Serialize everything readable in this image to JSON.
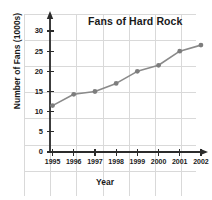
{
  "chart_data": {
    "type": "line",
    "title": "Fans of Hard Rock",
    "xlabel": "Year",
    "ylabel": "Number of Fans (1000s)",
    "categories": [
      "1995",
      "1996",
      "1997",
      "1998",
      "1999",
      "2000",
      "2001",
      "2002"
    ],
    "values": [
      11.5,
      14.3,
      15.0,
      17.0,
      20.0,
      21.5,
      25.0,
      26.5
    ],
    "series": [
      {
        "name": "Fans of Hard Rock",
        "values": [
          11.5,
          14.3,
          15.0,
          17.0,
          20.0,
          21.5,
          25.0,
          26.5
        ]
      }
    ],
    "ylim": [
      0,
      30
    ],
    "yticks": [
      0,
      5,
      10,
      15,
      20,
      25,
      30
    ],
    "ytick_labels": [
      "0",
      "5",
      "10",
      "15",
      "20",
      "25",
      "30"
    ],
    "xtick_labels": [
      "1995",
      "1996",
      "1997",
      "1998",
      "1999",
      "2000",
      "2001",
      "2002"
    ],
    "grid": true,
    "grid_color": "#d8d8d8",
    "legend": false,
    "legend_position": "none",
    "line_color": "#8a8a8a",
    "marker_color": "#7d7d7d",
    "marker": "circle",
    "axis_color": "#2b2b2b",
    "axis_arrows": true,
    "background_color": "#ffffff"
  }
}
